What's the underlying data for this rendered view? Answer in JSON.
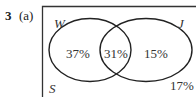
{
  "question": {
    "number": "3",
    "part": "(a)"
  },
  "venn": {
    "universal_label": "S",
    "sets": [
      {
        "label": "W"
      },
      {
        "label": "J"
      }
    ],
    "regions": {
      "w_only": "37%",
      "w_and_j": "31%",
      "j_only": "15%",
      "outside": "17%"
    }
  }
}
